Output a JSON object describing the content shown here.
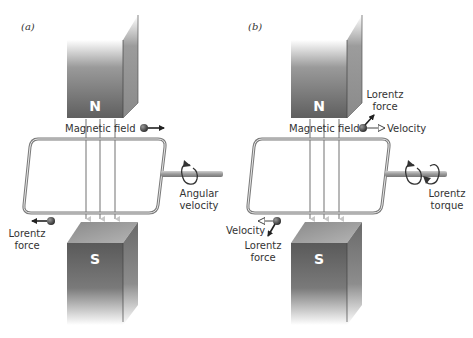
{
  "figure": {
    "panels": [
      {
        "tag": "(a)",
        "magnets": {
          "top_pole": "N",
          "bottom_pole": "S"
        },
        "labels": {
          "field": "Magnetic field",
          "force_line1": "Lorentz",
          "force_line2": "force",
          "angular_line1": "Angular",
          "angular_line2": "velocity"
        }
      },
      {
        "tag": "(b)",
        "magnets": {
          "top_pole": "N",
          "bottom_pole": "S"
        },
        "labels": {
          "field": "Magnetic field",
          "top_force_line1": "Lorentz",
          "top_force_line2": "force",
          "top_velocity": "Velocity",
          "bottom_velocity": "Velocity",
          "bottom_force_line1": "Lorentz",
          "bottom_force_line2": "force",
          "torque_line1": "Lorentz",
          "torque_line2": "torque"
        }
      }
    ],
    "colors": {
      "magnet_dark": "#5a5a5a",
      "magnet_light": "#ffffff",
      "coil": "#7a7a7a",
      "field_line": "#b0b0b0",
      "arrow": "#222222",
      "text": "#333333"
    }
  }
}
